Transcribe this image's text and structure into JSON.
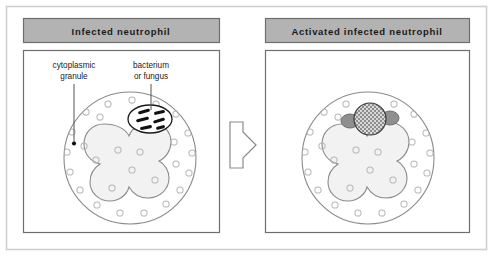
{
  "figure": {
    "panels": [
      {
        "id": "infected",
        "title": "Infected  neutrophil",
        "labels": [
          {
            "id": "granule",
            "line1": "cytoplasmic",
            "line2": "granule"
          },
          {
            "id": "microbe",
            "line1": "bacterium",
            "line2": "or fungus"
          }
        ]
      },
      {
        "id": "activated",
        "title": "Activated  infected  neutrophil",
        "labels": []
      }
    ],
    "arrow": {
      "name": "process-arrow",
      "direction": "right"
    },
    "colors": {
      "header_fill": "#b3b3b3",
      "header_stroke": "#6e6e6e",
      "panel_stroke": "#6e6e6e",
      "frame_stroke": "#cfcfcf",
      "cell_stroke": "#8a8a8a",
      "cell_fill": "#ffffff",
      "nucleus_fill": "#f2f2f2",
      "nucleus_stroke": "#8a8a8a",
      "granule_stroke": "#b8b8b8",
      "microbe_fill": "#111111",
      "vacuole_stroke": "#1a1a1a",
      "phagosome_fill": "#d8d8d8",
      "fusing_granule_fill": "#8f8f8f",
      "text": "#1a1a1a",
      "leader_stroke": "#555555"
    }
  }
}
